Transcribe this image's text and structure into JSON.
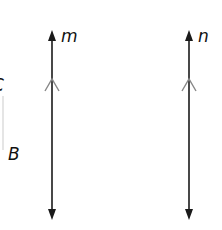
{
  "diagram": {
    "title": "",
    "colors": {
      "line": "#1a1a1a",
      "parallel_mark": "#888888",
      "faint_line": "#dddddd"
    },
    "lines": [
      {
        "id": "m",
        "label": "m",
        "x": 52,
        "y_top": 32,
        "y_bottom": 218,
        "direction": "vertical",
        "arrows": "both",
        "parallel_mark_y": 80
      },
      {
        "id": "n",
        "label": "n",
        "x": 189,
        "y_top": 32,
        "y_bottom": 218,
        "direction": "vertical",
        "arrows": "both",
        "parallel_mark_y": 80
      }
    ],
    "point_labels": [
      {
        "id": "C",
        "label": "C",
        "partially_visible": true
      },
      {
        "id": "B",
        "label": "B"
      }
    ],
    "relationship": "line m is parallel to line n"
  }
}
